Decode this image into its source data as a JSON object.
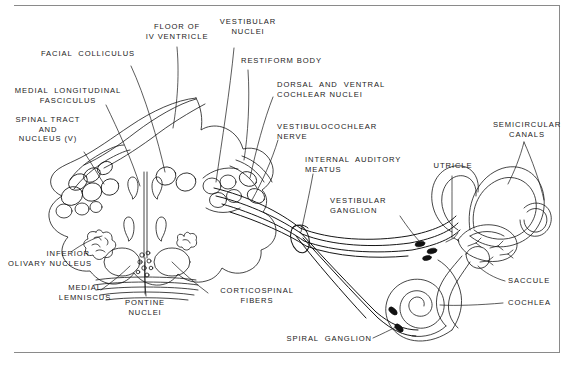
{
  "figure": {
    "stroke_color": "#161616",
    "background_color": "#ffffff",
    "rule_color": "#8a8a8a"
  },
  "labels": {
    "floor_of_iv_ventricle": "FLOOR OF\nIV VENTRICLE",
    "vestibular_nuclei": "VESTIBULAR\nNUCLEI",
    "facial_colliculus": "FACIAL  COLLICULUS",
    "restiform_body": "RESTIFORM BODY",
    "medial_longitudinal_fasciculus": "MEDIAL  LONGITUDINAL\nFASCICULUS",
    "dorsal_and_ventral_cochlear_nuclei": "DORSAL  AND  VENTRAL\nCOCHLEAR NUCLEI",
    "spinal_tract_and_nucleus_v": "SPINAL TRACT\nAND\nNUCLEUS (V)",
    "vestibulocochlear_nerve": "VESTIBULOCOCHLEAR\nNERVE",
    "semicircular_canals": "SEMICIRCULAR\nCANALS",
    "internal_auditory_meatus": "INTERNAL  AUDITORY\nMEATUS",
    "utricle": "UTRICLE",
    "vestibular_ganglion": "VESTIBULAR\nGANGLION",
    "inferior_olivary_nucleus": "INFERIOR\nOLIVARY NUCLEUS",
    "saccule": "SACCULE",
    "medial_lemniscus": "MEDIAL\nLEMNISCUS",
    "corticospinal_fibers": "CORTICOSPINAL\nFIBERS",
    "cochlea": "COCHLEA",
    "pontine_nuclei": "PONTINE\nNUCLEI",
    "spiral_ganglion": "SPIRAL  GANGLION"
  }
}
